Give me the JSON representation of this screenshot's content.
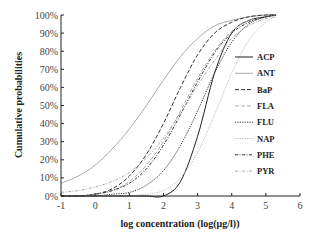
{
  "chart_data": {
    "type": "line",
    "title": "",
    "xlabel": "log concentration (log(μg/l))",
    "ylabel": "Cumulative probabilities",
    "xlim": [
      -1,
      6
    ],
    "ylim": [
      0,
      100
    ],
    "x_ticks": [
      "-1",
      "0",
      "1",
      "2",
      "3",
      "4",
      "5",
      "6"
    ],
    "y_ticks": [
      "0%",
      "10%",
      "20%",
      "30%",
      "40%",
      "50%",
      "60%",
      "70%",
      "80%",
      "90%",
      "100%"
    ],
    "grid": false,
    "legend_position": "right-inside",
    "x": [
      -1,
      -0.5,
      0,
      0.5,
      1,
      1.5,
      2,
      2.5,
      3,
      3.5,
      4,
      4.5,
      5,
      5.3
    ],
    "series": [
      {
        "name": "ACP",
        "style": "solid",
        "color": "#222222",
        "values": [
          0,
          0,
          0,
          0,
          0,
          0,
          0,
          8,
          33,
          68,
          90,
          97,
          99,
          100
        ]
      },
      {
        "name": "ANT",
        "style": "solid",
        "color": "#aaaaaa",
        "values": [
          7,
          11,
          17,
          26,
          37,
          50,
          64,
          77,
          87,
          94,
          97,
          99,
          100,
          100
        ]
      },
      {
        "name": "BaP",
        "style": "dashed",
        "color": "#333333",
        "values": [
          0,
          0,
          1,
          4,
          11,
          23,
          40,
          60,
          78,
          90,
          96,
          99,
          100,
          100
        ]
      },
      {
        "name": "FLA",
        "style": "dashed",
        "color": "#aaaaaa",
        "values": [
          0,
          0,
          1,
          3,
          8,
          17,
          30,
          47,
          65,
          80,
          91,
          97,
          99,
          100
        ]
      },
      {
        "name": "FLU",
        "style": "dotted",
        "color": "#333333",
        "values": [
          0,
          0,
          0,
          1,
          2,
          6,
          14,
          28,
          47,
          68,
          85,
          95,
          99,
          100
        ]
      },
      {
        "name": "NAP",
        "style": "dotted",
        "color": "#bbbbbb",
        "values": [
          0,
          0,
          0,
          0,
          0,
          1,
          3,
          10,
          24,
          45,
          68,
          86,
          96,
          99
        ]
      },
      {
        "name": "PHE",
        "style": "dash-dot",
        "color": "#333333",
        "values": [
          0,
          0,
          1,
          3,
          7,
          15,
          28,
          45,
          63,
          79,
          90,
          96,
          99,
          100
        ]
      },
      {
        "name": "PYR",
        "style": "dash-dot",
        "color": "#aaaaaa",
        "values": [
          2,
          3,
          5,
          8,
          13,
          21,
          32,
          46,
          61,
          75,
          87,
          94,
          98,
          99
        ]
      }
    ]
  }
}
